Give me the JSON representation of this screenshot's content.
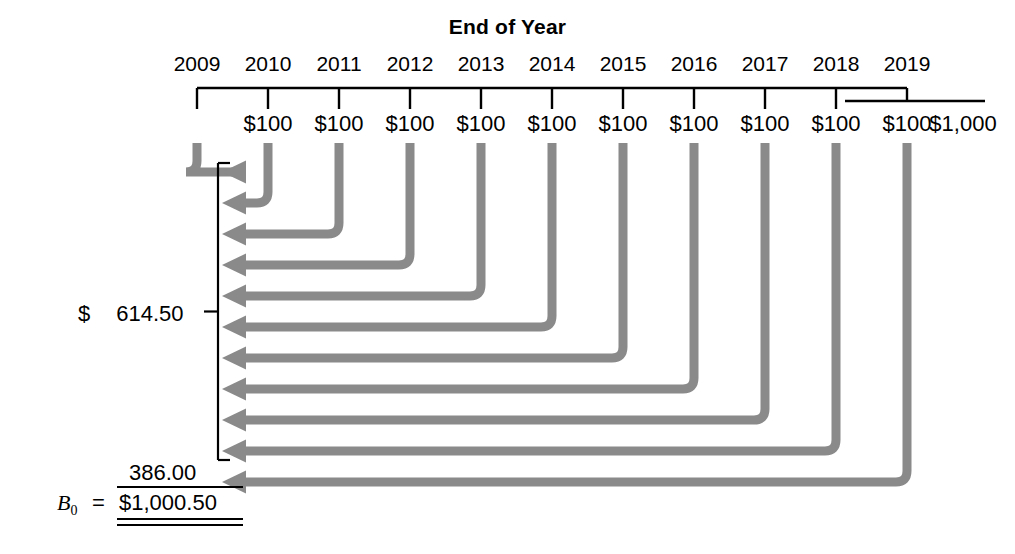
{
  "title": "End of Year",
  "timeline": {
    "years": [
      "2009",
      "2010",
      "2011",
      "2012",
      "2013",
      "2014",
      "2015",
      "2016",
      "2017",
      "2018",
      "2019"
    ],
    "cash_flows": [
      "$100",
      "$100",
      "$100",
      "$100",
      "$100",
      "$100",
      "$100",
      "$100",
      "$100",
      "$100",
      "$1,000"
    ]
  },
  "annotations": {
    "pv_annuity_currency": "$",
    "pv_annuity_value": "614.50",
    "pv_principal_value": "386.00",
    "b0_symbol": "B",
    "b0_subscript": "0",
    "b0_equals": "=",
    "b0_total": "$1,000.50"
  },
  "colors": {
    "arrow_gray": "#8a8a8a",
    "line_black": "#000000",
    "background": "#ffffff"
  },
  "geometry": {
    "tick_xs": [
      197,
      268,
      339,
      410,
      481,
      552,
      623,
      694,
      765,
      836,
      907
    ],
    "cash_label_xs": [
      268,
      339,
      410,
      481,
      552,
      623,
      694,
      765,
      836,
      907,
      963
    ],
    "axis_y": 88,
    "axis_tick_bottom": 109,
    "second_axis_y": 101,
    "second_axis_x_end": 985,
    "arrow_tip_x": 222,
    "arrow_first_y": 172,
    "arrow_spacing": 31,
    "arrow_count": 11,
    "bracket_x": 218
  }
}
